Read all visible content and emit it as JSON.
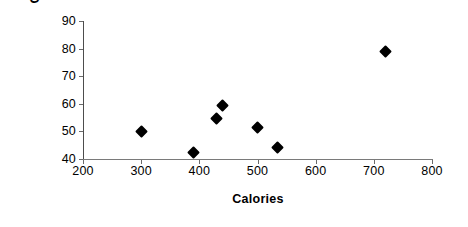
{
  "chart_data": {
    "type": "scatter",
    "title": "",
    "xlabel": "Calories",
    "ylabel": "Cholesterol",
    "xlim": [
      200,
      800
    ],
    "ylim": [
      40,
      90
    ],
    "xticks": [
      200,
      300,
      400,
      500,
      600,
      700,
      800
    ],
    "yticks": [
      40,
      50,
      60,
      70,
      80,
      90
    ],
    "xtick_labels": [
      "200",
      "300",
      "400",
      "500",
      "600",
      "700",
      "800"
    ],
    "ytick_labels": [
      "40",
      "50",
      "60",
      "70",
      "80",
      "90"
    ],
    "grid": false,
    "legend": false,
    "legend_position": "none",
    "marker": "diamond",
    "marker_color": "#000000",
    "series": [
      {
        "name": "Cholesterol vs Calories",
        "points": [
          {
            "x": 300,
            "y": 50
          },
          {
            "x": 390,
            "y": 42.5
          },
          {
            "x": 430,
            "y": 54.5
          },
          {
            "x": 440,
            "y": 59.5
          },
          {
            "x": 500,
            "y": 51.5
          },
          {
            "x": 535,
            "y": 44
          },
          {
            "x": 720,
            "y": 79
          }
        ]
      }
    ]
  },
  "colors": {
    "background": "#ffffff",
    "axis": "#6b6b6b",
    "text": "#000000",
    "marker": "#000000"
  }
}
